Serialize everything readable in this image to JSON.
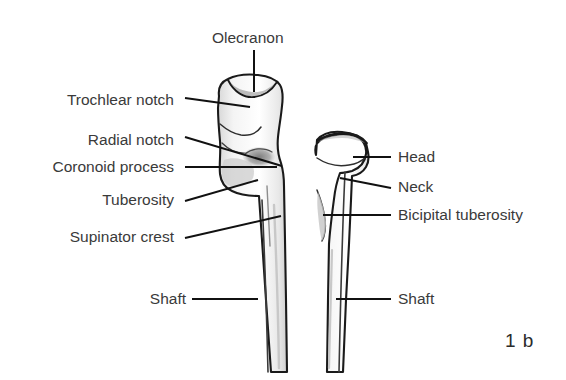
{
  "figure": {
    "number": "1 b",
    "background_color": "#ffffff",
    "label_color": "#3a3a3a",
    "line_color": "#1a1a1a",
    "bone_outline_color": "#1a1a1a",
    "bone_fill_color": "#ffffff",
    "bone_shading_color": "#b9b9b9"
  },
  "labels": {
    "olecranon": "Olecranon",
    "trochlear_notch": "Trochlear notch",
    "radial_notch": "Radial notch",
    "coronoid_process": "Coronoid process",
    "tuberosity": "Tuberosity",
    "supinator_crest": "Supinator crest",
    "shaft_left": "Shaft",
    "head": "Head",
    "neck": "Neck",
    "bicipital_tuberosity": "Bicipital tuberosity",
    "shaft_right": "Shaft"
  },
  "left_labels": [
    {
      "key": "trochlear_notch",
      "text": "Trochlear notch",
      "x_right": 178,
      "y": 101
    },
    {
      "key": "radial_notch",
      "text": "Radial notch",
      "x_right": 178,
      "y": 141
    },
    {
      "key": "coronoid_process",
      "text": "Coronoid process",
      "x_right": 178,
      "y": 167
    },
    {
      "key": "tuberosity",
      "text": "Tuberosity",
      "x_right": 178,
      "y": 200
    },
    {
      "key": "supinator_crest",
      "text": "Supinator crest",
      "x_right": 178,
      "y": 237
    },
    {
      "key": "shaft_left",
      "text": "Shaft",
      "x_right": 178,
      "y": 299
    }
  ],
  "right_labels": [
    {
      "key": "head",
      "text": "Head",
      "x_left": 398,
      "y": 158
    },
    {
      "key": "neck",
      "text": "Neck",
      "x_left": 398,
      "y": 186
    },
    {
      "key": "bicipital_tuberosity",
      "text": "Bicipital tuberosity",
      "x_left": 398,
      "y": 215
    },
    {
      "key": "shaft_right",
      "text": "Shaft",
      "x_left": 398,
      "y": 299
    }
  ],
  "top_label": {
    "key": "olecranon",
    "text": "Olecranon",
    "x_center": 254,
    "y": 39
  },
  "bones": [
    {
      "name": "ulna",
      "side": "left",
      "parts": [
        "Olecranon",
        "Trochlear notch",
        "Radial notch",
        "Coronoid process",
        "Tuberosity",
        "Supinator crest",
        "Shaft"
      ]
    },
    {
      "name": "radius",
      "side": "right",
      "parts": [
        "Head",
        "Neck",
        "Bicipital tuberosity",
        "Shaft"
      ]
    }
  ]
}
